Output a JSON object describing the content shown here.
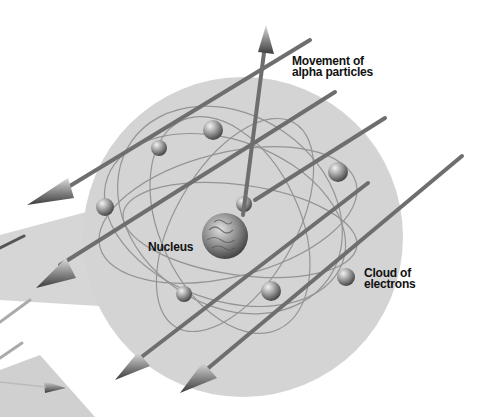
{
  "diagram": {
    "labels": {
      "alpha_line1": "Movement of",
      "alpha_line2": "alpha particles",
      "nucleus": "Nucleus",
      "cloud_line1": "Cloud of",
      "cloud_line2": "electrons"
    },
    "colors": {
      "cloud": "#d4d4d4",
      "arrow": "#7a7a7a",
      "orbit": "#8a8a8a",
      "electron": "#9a9a9a",
      "nucleus": "#8c8c8c",
      "text": "#111111"
    },
    "components": [
      "atom-cloud",
      "nucleus",
      "electrons",
      "orbits",
      "alpha-particle-arrows",
      "deflected-arrow"
    ]
  }
}
